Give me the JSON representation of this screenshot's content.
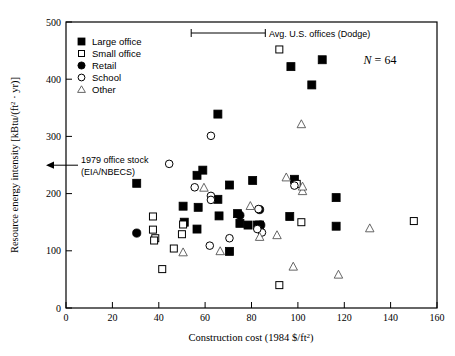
{
  "chart_data": {
    "type": "scatter",
    "title": "",
    "xlabel": "Construction cost (1984 $/ft2)",
    "xlabel_main": "Construction cost (1984 $/ft",
    "xlabel_sup": "2",
    "xlabel_tail": ")",
    "ylabel": "Resource energy intensity [kBtu/(ft2 · yr)]",
    "ylabel_part1": "Resource energy intensity [kBtu/(ft",
    "ylabel_sup": "2",
    "ylabel_part2": " · yr)]",
    "xlim": [
      0,
      160
    ],
    "ylim": [
      0,
      500
    ],
    "xticks": [
      0,
      20,
      40,
      60,
      80,
      100,
      120,
      140,
      160
    ],
    "yticks": [
      0,
      100,
      200,
      300,
      400,
      500
    ],
    "grid": false,
    "legend_position": "upper-left-inside",
    "sample_size_label": "N = 64",
    "sample_size_symbol": "N",
    "sample_size_value": "= 64",
    "series": [
      {
        "name": "Large office",
        "marker": "filled-square",
        "points": [
          [
            30.5,
            218
          ],
          [
            56.5,
            232
          ],
          [
            59.0,
            241
          ],
          [
            50.5,
            178
          ],
          [
            57.0,
            176
          ],
          [
            65.5,
            339
          ],
          [
            65.5,
            190
          ],
          [
            70.5,
            215
          ],
          [
            66.0,
            161
          ],
          [
            74.0,
            165
          ],
          [
            75.0,
            148
          ],
          [
            78.5,
            145
          ],
          [
            80.5,
            223
          ],
          [
            82.5,
            145
          ],
          [
            83.5,
            145
          ],
          [
            70.5,
            99
          ],
          [
            51.0,
            150
          ],
          [
            56.5,
            138
          ],
          [
            97.0,
            422
          ],
          [
            110.5,
            434
          ],
          [
            106.0,
            390
          ],
          [
            98.5,
            225
          ],
          [
            96.5,
            160
          ],
          [
            116.5,
            193
          ],
          [
            116.5,
            143
          ]
        ]
      },
      {
        "name": "Small office",
        "marker": "open-square",
        "points": [
          [
            37.5,
            160
          ],
          [
            37.5,
            137
          ],
          [
            38.5,
            122
          ],
          [
            38.0,
            118
          ],
          [
            41.5,
            68
          ],
          [
            46.5,
            104
          ],
          [
            50.5,
            146
          ],
          [
            50.0,
            129
          ],
          [
            99.5,
            217
          ],
          [
            92.0,
            452
          ],
          [
            92.0,
            40
          ],
          [
            101.5,
            150
          ],
          [
            150.0,
            152
          ]
        ]
      },
      {
        "name": "Retail",
        "marker": "filled-circle",
        "points": [
          [
            30.5,
            131
          ],
          [
            75.0,
            162
          ],
          [
            83.5,
            172
          ],
          [
            84.0,
            145
          ]
        ]
      },
      {
        "name": "School",
        "marker": "open-circle",
        "points": [
          [
            44.5,
            252
          ],
          [
            55.5,
            211
          ],
          [
            62.5,
            301
          ],
          [
            62.5,
            196
          ],
          [
            62.5,
            189
          ],
          [
            62.0,
            109
          ],
          [
            70.5,
            122
          ],
          [
            83.0,
            173
          ],
          [
            84.5,
            132
          ],
          [
            82.5,
            138
          ],
          [
            98.5,
            214
          ]
        ]
      },
      {
        "name": "Other",
        "marker": "open-triangle",
        "points": [
          [
            50.5,
            97
          ],
          [
            59.5,
            210
          ],
          [
            66.5,
            99
          ],
          [
            79.5,
            178
          ],
          [
            83.5,
            124
          ],
          [
            91.0,
            127
          ],
          [
            95.0,
            228
          ],
          [
            102.0,
            204
          ],
          [
            102.0,
            212
          ],
          [
            101.5,
            321
          ],
          [
            98.0,
            72
          ],
          [
            117.5,
            58
          ],
          [
            131.0,
            139
          ]
        ]
      }
    ],
    "annotations": [
      {
        "name": "avg-us-offices",
        "label": "Avg. U.S. offices (Dodge)",
        "type": "range-bar",
        "x_start": 54,
        "x_end": 86,
        "y": 478
      },
      {
        "name": "office-stock-1979",
        "label_line1": "1979 office stock",
        "label_line2": "(EIA/NBECS)",
        "type": "arrow-to-axis",
        "y": 250
      }
    ]
  }
}
